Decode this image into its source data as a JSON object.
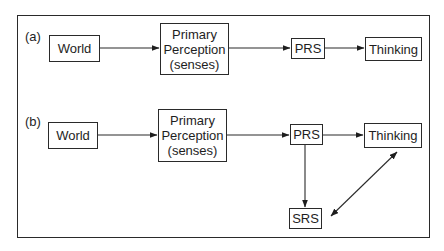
{
  "diagram": {
    "panels": [
      {
        "id": "a",
        "label": "(a)",
        "nodes": {
          "world": "World",
          "primary": "Primary\nPerception\n(senses)",
          "prs": "PRS",
          "thinking": "Thinking"
        },
        "edges": [
          {
            "from": "World",
            "to": "Primary Perception (senses)",
            "type": "arrow"
          },
          {
            "from": "Primary Perception (senses)",
            "to": "PRS",
            "type": "arrow"
          },
          {
            "from": "PRS",
            "to": "Thinking",
            "type": "arrow"
          }
        ]
      },
      {
        "id": "b",
        "label": "(b)",
        "nodes": {
          "world": "World",
          "primary": "Primary\nPerception\n(senses)",
          "prs": "PRS",
          "thinking": "Thinking",
          "srs": "SRS"
        },
        "edges": [
          {
            "from": "World",
            "to": "Primary Perception (senses)",
            "type": "arrow"
          },
          {
            "from": "Primary Perception (senses)",
            "to": "PRS",
            "type": "arrow"
          },
          {
            "from": "PRS",
            "to": "Thinking",
            "type": "arrow"
          },
          {
            "from": "PRS",
            "to": "SRS",
            "type": "arrow"
          },
          {
            "from": "SRS",
            "to": "Thinking",
            "type": "bidirectional-arrow"
          }
        ]
      }
    ],
    "colors": {
      "line": "#2a2a2a",
      "text": "#1e1e1e",
      "background": "#ffffff"
    }
  }
}
